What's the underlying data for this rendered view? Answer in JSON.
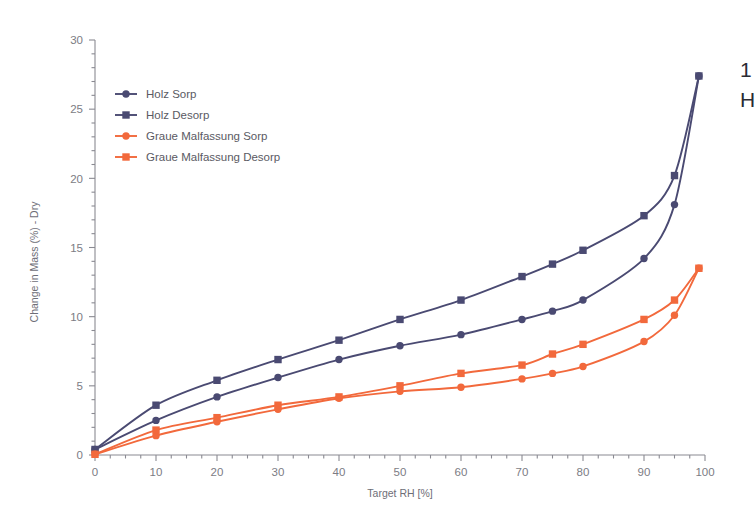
{
  "chart_data": {
    "type": "line",
    "title": "",
    "subtitle": "",
    "xlabel": "Target RH [%]",
    "ylabel": "Change in Mass (%) - Dry",
    "xlim": [
      0,
      100
    ],
    "ylim": [
      0,
      30
    ],
    "xticks": [
      0,
      10,
      20,
      30,
      40,
      50,
      60,
      70,
      80,
      90,
      100
    ],
    "yticks": [
      0,
      5,
      10,
      15,
      20,
      25,
      30
    ],
    "xtick_labels": [
      "0",
      "10",
      "20",
      "30",
      "40",
      "50",
      "60",
      "70",
      "80",
      "90",
      "100"
    ],
    "ytick_labels": [
      "0",
      "5",
      "10",
      "15",
      "20",
      "25",
      "30"
    ],
    "x_minor_step": 2.5,
    "y_minor_step": 1,
    "grid": false,
    "legend_position": "upper-left",
    "series": [
      {
        "name": "Holz Sorp",
        "color": "#4a4a72",
        "marker": "circle",
        "x": [
          0,
          10,
          20,
          30,
          40,
          50,
          60,
          70,
          75,
          80,
          90,
          95,
          99
        ],
        "values": [
          0.4,
          2.5,
          4.2,
          5.6,
          6.9,
          7.9,
          8.7,
          9.8,
          10.4,
          11.2,
          14.2,
          18.1,
          27.4
        ]
      },
      {
        "name": "Holz Desorp",
        "color": "#4a4a72",
        "marker": "square",
        "x": [
          0,
          10,
          20,
          30,
          40,
          50,
          60,
          70,
          75,
          80,
          90,
          95,
          99
        ],
        "values": [
          0.4,
          3.6,
          5.4,
          6.9,
          8.3,
          9.8,
          11.2,
          12.9,
          13.8,
          14.8,
          17.3,
          20.2,
          27.4
        ]
      },
      {
        "name": "Graue Malfassung Sorp",
        "color": "#f2693c",
        "marker": "circle",
        "x": [
          0,
          10,
          20,
          30,
          40,
          50,
          60,
          70,
          75,
          80,
          90,
          95,
          99
        ],
        "values": [
          0.05,
          1.4,
          2.4,
          3.3,
          4.1,
          4.6,
          4.9,
          5.5,
          5.9,
          6.4,
          8.2,
          10.1,
          13.5
        ]
      },
      {
        "name": "Graue Malfassung Desorp",
        "color": "#f2693c",
        "marker": "square",
        "x": [
          0,
          10,
          20,
          30,
          40,
          50,
          60,
          70,
          75,
          80,
          90,
          95,
          99
        ],
        "values": [
          0.05,
          1.8,
          2.7,
          3.6,
          4.2,
          5.0,
          5.9,
          6.5,
          7.3,
          8.0,
          9.8,
          11.2,
          13.5
        ]
      }
    ]
  },
  "legend": {
    "items": [
      {
        "label": "Holz Sorp"
      },
      {
        "label": "Holz Desorp"
      },
      {
        "label": "Graue Malfassung Sorp"
      },
      {
        "label": "Graue Malfassung Desorp"
      }
    ]
  },
  "edge_text": {
    "line1": "1",
    "line2": "H"
  },
  "colors": {
    "holz": "#4a4a72",
    "malfassung": "#f2693c",
    "axis": "#8a8a92",
    "tick_text": "#7c7c84",
    "background": "#ffffff"
  }
}
